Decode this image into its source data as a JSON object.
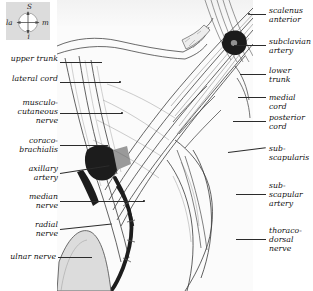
{
  "figure": {
    "background_color": "#ffffff",
    "panel_color": "#fbfbfb",
    "ink_color": "#2b2b2b"
  },
  "compass": {
    "name": "orientation-compass",
    "background_color": "#dcdcdc",
    "superior": "S",
    "inferior": "i",
    "lateral": "la",
    "medial": "m"
  },
  "labels_left": [
    {
      "id": "upper-trunk",
      "text": "upper trunk",
      "y": 58,
      "lines": 1,
      "leader_y": 62,
      "leader_x": 60,
      "leader_w": 42
    },
    {
      "id": "lateral-cord",
      "text": "lateral cord",
      "y": 78,
      "lines": 1,
      "leader_y": 82,
      "leader_x": 60,
      "leader_w": 60
    },
    {
      "id": "musculocutaneous-nerve",
      "text": "musculo-\ncutaneous\nnerve",
      "y": 100,
      "lines": 3,
      "leader_y": 113,
      "leader_x": 60,
      "leader_w": 62
    },
    {
      "id": "coracobrachialis",
      "text": "coraco-\nbrachialis",
      "y": 136,
      "lines": 2,
      "leader_y": 145,
      "leader_x": 60,
      "leader_w": 48
    },
    {
      "id": "axillary-artery",
      "text": "axillary\nartery",
      "y": 164,
      "lines": 2,
      "leader_y": 173,
      "leader_x": 60,
      "leader_w": 50
    },
    {
      "id": "median-nerve",
      "text": "median\nnerve",
      "y": 192,
      "lines": 2,
      "leader_y": 201,
      "leader_x": 60,
      "leader_w": 84
    },
    {
      "id": "radial-nerve",
      "text": "radial\nnerve",
      "y": 220,
      "lines": 2,
      "leader_y": 229,
      "leader_x": 60,
      "leader_w": 52
    },
    {
      "id": "ulnar-nerve",
      "text": "ulnar nerve",
      "y": 253,
      "lines": 1,
      "leader_y": 257,
      "leader_x": 58,
      "leader_w": 34
    }
  ],
  "labels_right": [
    {
      "id": "scalenus-anterior",
      "text": "scalenus\nanterior",
      "y": 6,
      "lines": 2,
      "leader_y": 14,
      "leader_x": 250,
      "leader_w": 16
    },
    {
      "id": "subclavian-artery",
      "text": "subclavian\nartery",
      "y": 36,
      "lines": 2,
      "leader_y": 45,
      "leader_x": 234,
      "leader_w": 32
    },
    {
      "id": "lower-trunk",
      "text": "lower\ntrunk",
      "y": 66,
      "lines": 2,
      "leader_y": 74,
      "leader_x": 240,
      "leader_w": 26
    },
    {
      "id": "medial-cord",
      "text": "medial cord",
      "y": 93,
      "lines": 1,
      "leader_y": 97,
      "leader_x": 238,
      "leader_w": 28
    },
    {
      "id": "posterior-cord",
      "text": "posterior\ncord",
      "y": 113,
      "lines": 2,
      "leader_y": 121,
      "leader_x": 233,
      "leader_w": 33
    },
    {
      "id": "subscapularis",
      "text": "sub-\nscapularis",
      "y": 143,
      "lines": 2,
      "leader_y": 152,
      "leader_x": 228,
      "leader_w": 38
    },
    {
      "id": "subscapular-artery",
      "text": "sub-\nscapular\nartery",
      "y": 181,
      "lines": 3,
      "leader_y": 194,
      "leader_x": 236,
      "leader_w": 30
    },
    {
      "id": "thoracodorsal-nerve",
      "text": "thoraco-\ndorsal\nnerve",
      "y": 226,
      "lines": 3,
      "leader_y": 239,
      "leader_x": 236,
      "leader_w": 30
    }
  ]
}
